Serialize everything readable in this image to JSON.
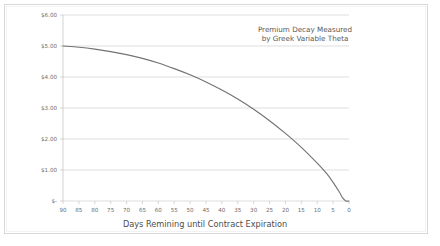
{
  "chart_data": {
    "type": "line",
    "title": "",
    "annotation": [
      "Premium Decay Measured",
      "by Greek Variable Theta"
    ],
    "xlabel": "Days Remining until Contract Expiration",
    "ylabel": "",
    "x_reversed": true,
    "xlim": [
      90,
      0
    ],
    "ylim": [
      0,
      6
    ],
    "grid": true,
    "legend": "none",
    "x_ticks": [
      90,
      85,
      80,
      75,
      70,
      65,
      60,
      55,
      50,
      45,
      40,
      35,
      30,
      25,
      20,
      15,
      10,
      5,
      0
    ],
    "x_tick_labels": [
      "90",
      "85",
      "80",
      "75",
      "70",
      "65",
      "60",
      "55",
      "50",
      "45",
      "40",
      "35",
      "30",
      "25",
      "20",
      "15",
      "10",
      "5",
      "0"
    ],
    "y_ticks": [
      6,
      5,
      4,
      3,
      2,
      1,
      0
    ],
    "y_tick_labels": [
      "$6.00",
      "$5.00",
      "$4.00",
      "$3.00",
      "$2.00",
      "$1.00",
      "$-"
    ],
    "series": [
      {
        "name": "Option Premium",
        "color": "#737373",
        "x": [
          90,
          85,
          80,
          75,
          70,
          65,
          60,
          55,
          50,
          45,
          40,
          35,
          30,
          25,
          20,
          15,
          10,
          7,
          5,
          3,
          2,
          1,
          0
        ],
        "values": [
          5.0,
          4.96,
          4.9,
          4.82,
          4.72,
          4.6,
          4.45,
          4.27,
          4.07,
          3.84,
          3.58,
          3.29,
          2.96,
          2.59,
          2.18,
          1.73,
          1.22,
          0.88,
          0.6,
          0.28,
          0.1,
          0.0,
          0.0
        ]
      }
    ]
  },
  "colors": {
    "line": "#737373",
    "grid": "#d0d0d0",
    "axis": "#bfbfbf",
    "frame": "#d9d9d9",
    "tick_text": "#6e6e6e",
    "title_text": "#4d4d4d",
    "annotation_text": "#595959",
    "background": "#ffffff"
  }
}
